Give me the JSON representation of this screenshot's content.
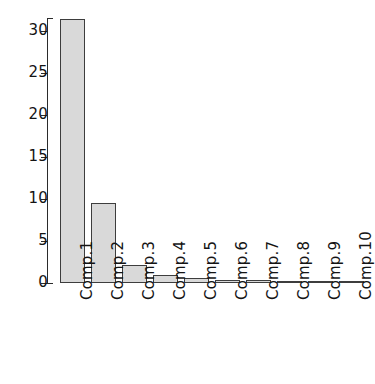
{
  "chart_data": {
    "type": "bar",
    "title": "",
    "subtitle": "",
    "xlabel": "",
    "ylabel": "",
    "categories": [
      "Comp.1",
      "Comp.2",
      "Comp.3",
      "Comp.4",
      "Comp.5",
      "Comp.6",
      "Comp.7",
      "Comp.8",
      "Comp.9",
      "Comp.10"
    ],
    "values": [
      31.4,
      9.55,
      2.15,
      0.9,
      0.6,
      0.35,
      0.3,
      0.2,
      0.12,
      0.08
    ],
    "ylim": [
      0,
      31.9
    ],
    "xlim_note": "10 equally spaced categorical bars",
    "yticks": [
      0,
      5,
      10,
      15,
      20,
      25,
      30
    ],
    "ytick_labels": [
      "0",
      "5",
      "10",
      "15",
      "20",
      "25",
      "30"
    ],
    "xtick_labels": [
      "Comp.1",
      "Comp.2",
      "Comp.3",
      "Comp.4",
      "Comp.5",
      "Comp.6",
      "Comp.7",
      "Comp.8",
      "Comp.9",
      "Comp.10"
    ],
    "xtick_rotation_degrees": 90,
    "grid": false,
    "legend": null,
    "legend_position": "none",
    "annotations": [],
    "series": [
      {
        "name": "Variances",
        "values": [
          31.4,
          9.55,
          2.15,
          0.9,
          0.6,
          0.35,
          0.3,
          0.2,
          0.12,
          0.08
        ]
      }
    ]
  },
  "style": {
    "bar_fill": "#d9d9d9",
    "bar_border": "#3d3d3d",
    "axis_color": "#2b2b2b",
    "text_color": "#141414",
    "background": "#ffffff"
  },
  "geometry": {
    "y_zero_px": 283,
    "y_top_px": 18,
    "px_per_unit": 8.4,
    "bar_left_start_px": 60,
    "bar_width_px": 25,
    "bar_pitch_px": 31,
    "label_baseline_px": 300
  }
}
